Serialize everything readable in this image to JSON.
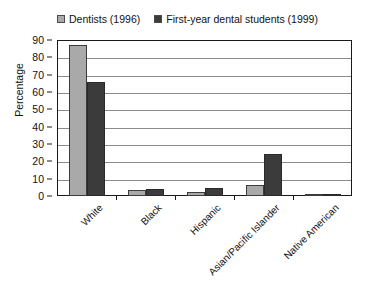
{
  "chart_data": {
    "type": "bar",
    "title": "",
    "subtitle": "",
    "xlabel": "",
    "ylabel": "Percentage",
    "ylim": [
      0,
      90
    ],
    "ytick_step": 10,
    "yticks": [
      0,
      10,
      20,
      30,
      40,
      50,
      60,
      70,
      80,
      90
    ],
    "grid": true,
    "legend_position": "top-center",
    "categories": [
      "White",
      "Black",
      "Hispanic",
      "Asian/Pacific Islander",
      "Native American"
    ],
    "series": [
      {
        "name": "Dentists (1996)",
        "color": "#a9a9a9",
        "values": [
          87,
          3.2,
          2.5,
          6.5,
          0.5
        ]
      },
      {
        "name": "First-year dental students (1999)",
        "color": "#3b3b3b",
        "values": [
          66,
          4,
          4.5,
          24,
          1
        ]
      }
    ]
  },
  "legend": {
    "entries": [
      {
        "label": "Dentists (1996)",
        "color": "#a9a9a9"
      },
      {
        "label": "First-year dental students (1999)",
        "color": "#3b3b3b"
      }
    ]
  },
  "axes": {
    "y_title": "Percentage",
    "y_labels": [
      "90",
      "80",
      "70",
      "60",
      "50",
      "40",
      "30",
      "20",
      "10",
      "0"
    ],
    "x_labels": [
      "White",
      "Black",
      "Hispanic",
      "Asian/Pacific Islander",
      "Native American"
    ]
  }
}
